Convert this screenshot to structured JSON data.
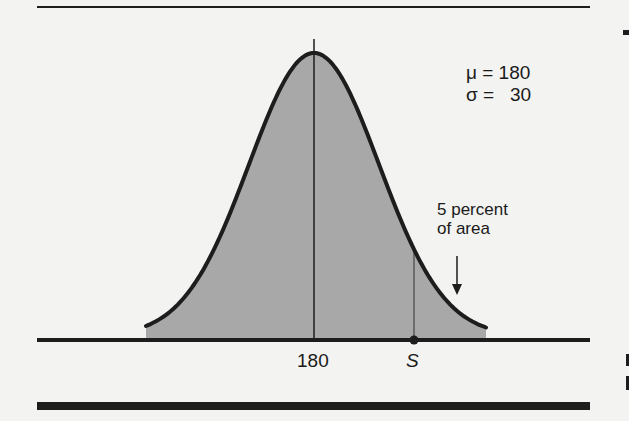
{
  "chart_data": {
    "type": "area",
    "title": "",
    "distribution": "normal",
    "mu": 180,
    "sigma": 30,
    "x_ticks": [
      "180",
      "S"
    ],
    "tick_values": {
      "mean": 180,
      "S": 229.35
    },
    "annotations": [
      {
        "text": "5 percent\nof area",
        "target": "upper tail beyond S",
        "arrow": "down"
      }
    ],
    "xlabel": "",
    "ylabel": "",
    "grid": false,
    "legend": null,
    "colors": {
      "fill": "#a8a8a8",
      "stroke": "#1d1d1d",
      "background": "#f3f3f1"
    }
  },
  "params": {
    "mu_label": "μ = 180",
    "sigma_label": "σ =   30"
  },
  "annotation": {
    "line1": "5 percent",
    "line2": "of area"
  },
  "axis": {
    "mean_tick": "180",
    "s_tick": "S"
  }
}
